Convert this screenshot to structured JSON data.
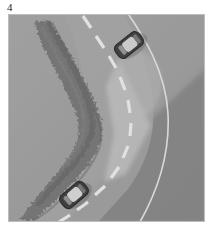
{
  "figure": {
    "label": "4",
    "caption_text": "4"
  },
  "panel": {
    "name": "overhead-road-scene",
    "width": 197,
    "height": 208,
    "background_color": "#9a9a9a"
  },
  "scene": {
    "description": "Overhead grayscale view of a curving two-lane road with two cars",
    "view": "aerial-top-down",
    "palette": {
      "terrain_base": "#9c9c9c",
      "terrain_light": "#ababab",
      "terrain_shadow": "#7e7e7e",
      "road_surface": "#a3a3a3",
      "road_highlight": "#bcbcbc",
      "rock_strip": "#6e6e6e",
      "rock_strip_dark": "#5d5d5d",
      "lane_marking": "#f2f2f2",
      "edge_line": "#e8e8e8",
      "car_body": "#2b2b2b",
      "car_roof": "#d8d8d8",
      "car_outline": "#171717"
    },
    "elements": [
      {
        "name": "terrain-background",
        "type": "ground",
        "tone": "#9c9c9c"
      },
      {
        "name": "shadow-wedge-right",
        "type": "shading",
        "tone": "#7e7e7e",
        "position": "lower-right diagonal"
      },
      {
        "name": "highlight-wedge-center",
        "type": "shading",
        "tone": "#bcbcbc",
        "position": "inner curve of road"
      },
      {
        "name": "rock-ridge",
        "type": "rocky-vegetation-strip",
        "tone": "#6e6e6e",
        "position": "runs diagonally from top-center-left to bottom-left"
      },
      {
        "name": "road-centerline",
        "type": "dashed-white-line",
        "tone": "#f2f2f2",
        "dash_count": 11
      },
      {
        "name": "road-edge-line",
        "type": "solid-white-curve",
        "tone": "#e8e8e8"
      }
    ]
  },
  "vehicles": [
    {
      "name": "car-upper",
      "id": "vehicle-1",
      "position_label": "upper-right",
      "cx": 121,
      "cy": 31,
      "rotation_deg": -38,
      "body_color": "#2b2b2b",
      "roof_color": "#d8d8d8",
      "length": 30,
      "width": 16
    },
    {
      "name": "car-lower",
      "id": "vehicle-2",
      "position_label": "lower-left",
      "cx": 66,
      "cy": 181,
      "rotation_deg": -40,
      "body_color": "#2b2b2b",
      "roof_color": "#d8d8d8",
      "length": 30,
      "width": 16
    }
  ],
  "lane_markings": {
    "name": "centerline-dashes",
    "color": "#f2f2f2",
    "dashes": [
      {
        "x1": 75,
        "y1": 2,
        "x2": 83,
        "y2": 14
      },
      {
        "x1": 88,
        "y1": 22,
        "x2": 96,
        "y2": 34
      },
      {
        "x1": 101,
        "y1": 42,
        "x2": 108,
        "y2": 54
      },
      {
        "x1": 112,
        "y1": 63,
        "x2": 117,
        "y2": 76
      },
      {
        "x1": 120,
        "y1": 86,
        "x2": 122,
        "y2": 99
      },
      {
        "x1": 123,
        "y1": 109,
        "x2": 122,
        "y2": 122
      },
      {
        "x1": 120,
        "y1": 132,
        "x2": 115,
        "y2": 144
      },
      {
        "x1": 111,
        "y1": 153,
        "x2": 103,
        "y2": 164
      },
      {
        "x1": 97,
        "y1": 172,
        "x2": 87,
        "y2": 181
      },
      {
        "x1": 80,
        "y1": 188,
        "x2": 69,
        "y2": 196
      },
      {
        "x1": 62,
        "y1": 201,
        "x2": 51,
        "y2": 208
      }
    ]
  },
  "edge_line": {
    "name": "road-edge-curve",
    "color": "#e8e8e8",
    "path_description": "from top near x=128 curving right to x=168 mid then down-left to x=140 at bottom"
  }
}
